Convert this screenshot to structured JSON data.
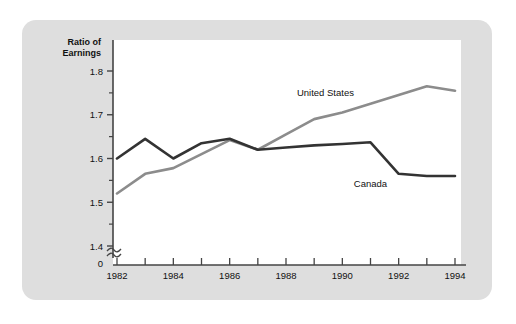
{
  "chart_data": {
    "type": "line",
    "title": "",
    "subtitle": "",
    "xlabel": "",
    "ylabel": "Ratio of Earnings",
    "ylabel_line1": "Ratio of",
    "ylabel_line2": "Earnings",
    "x": [
      1982,
      1983,
      1984,
      1985,
      1986,
      1987,
      1988,
      1989,
      1990,
      1991,
      1992,
      1993,
      1994
    ],
    "xtick_labels": [
      "1982",
      "",
      "1984",
      "",
      "1986",
      "",
      "1988",
      "",
      "1990",
      "",
      "1992",
      "",
      "1994"
    ],
    "xlim": [
      1982,
      1994
    ],
    "ylim": [
      1.4,
      1.8
    ],
    "ytick_values": [
      1.4,
      1.5,
      1.6,
      1.7,
      1.8
    ],
    "ytick_labels": [
      "1.4",
      "1.5",
      "1.6",
      "1.7",
      "1.8"
    ],
    "yminor_tick_values": [
      1.45,
      1.55,
      1.65,
      1.75
    ],
    "axis_break": true,
    "axis_break_label": "0",
    "grid": false,
    "legend_position": "inline-annotation",
    "series": [
      {
        "name": "United States",
        "color": "#8c8c8c",
        "label_x": 1989.4,
        "label_y": 1.742,
        "values": [
          1.52,
          1.565,
          1.578,
          1.61,
          1.642,
          1.62,
          1.655,
          1.69,
          1.705,
          1.725,
          1.745,
          1.765,
          1.755
        ]
      },
      {
        "name": "Canada",
        "color": "#333333",
        "label_x": 1991.0,
        "label_y": 1.536,
        "values": [
          1.6,
          1.645,
          1.6,
          1.635,
          1.645,
          1.62,
          1.625,
          1.63,
          1.633,
          1.637,
          1.565,
          1.56,
          1.56
        ]
      }
    ]
  },
  "style": {
    "card_background": "#dedede",
    "plot_background": "#ffffff",
    "axis_color": "#444444",
    "text_color": "#111111"
  }
}
